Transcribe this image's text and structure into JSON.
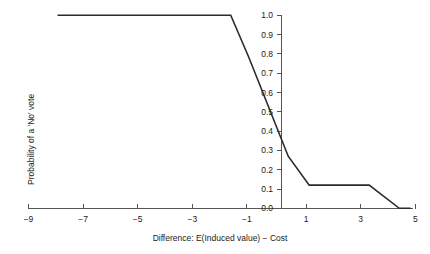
{
  "chart_data": {
    "type": "line",
    "title": "",
    "xlabel": "Difference: E(Induced value) − Cost",
    "ylabel": "Probability of a 'No' vote",
    "xlim": [
      -9,
      5
    ],
    "ylim": [
      0.0,
      1.0
    ],
    "grid": false,
    "legend": "none",
    "x_ticks": [
      -9,
      -7,
      -5,
      -3,
      -1,
      1,
      3,
      5
    ],
    "x_tick_labels": [
      "−9",
      "−7",
      "−5",
      "−3",
      "−1",
      "1",
      "3",
      "5"
    ],
    "y_ticks": [
      0.0,
      0.1,
      0.2,
      0.3,
      0.4,
      0.5,
      0.6,
      0.7,
      0.8,
      0.9,
      1.0
    ],
    "y_tick_labels": [
      "0.0",
      "0.1",
      "0.2",
      "0.3",
      "0.4",
      "0.5",
      "0.6",
      "0.7",
      "0.8",
      "0.9",
      "1.0"
    ],
    "y_axis_position_x": 0,
    "series": [
      {
        "name": "Probability of a 'No' vote",
        "color": "#2b2b2b",
        "x": [
          -7.95,
          -1.68,
          -1.02,
          0.4,
          1.16,
          3.33,
          4.42,
          4.83
        ],
        "y": [
          1.0,
          1.0,
          0.78,
          0.27,
          0.12,
          0.12,
          0.0,
          0.0
        ]
      }
    ]
  },
  "axes": {
    "x_axis_title": "Difference: E(Induced value) − Cost",
    "y_axis_title": "Probability of a 'No' vote"
  },
  "colors": {
    "line": "#2b2b2b",
    "axis": "#555555",
    "text": "#1a1a1a",
    "background": "#ffffff"
  }
}
